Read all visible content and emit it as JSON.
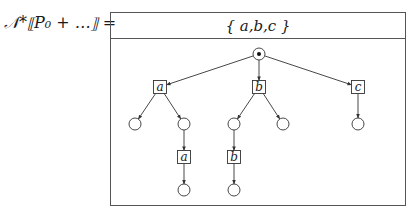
{
  "equation": {
    "lhs": "𝒩*⟦P₀ + …⟧ ="
  },
  "frame": {
    "header": "{ a,b,c }"
  },
  "tree": {
    "root": {
      "id": "root",
      "type": "root-circle",
      "x": 259,
      "y": 54
    },
    "nodes": [
      {
        "id": "a1",
        "type": "box",
        "label": "a",
        "x": 160,
        "y": 87
      },
      {
        "id": "b1",
        "type": "box",
        "label": "b",
        "x": 259,
        "y": 87
      },
      {
        "id": "c1",
        "type": "box",
        "label": "c",
        "x": 358,
        "y": 87
      },
      {
        "id": "a1l",
        "type": "circle",
        "x": 135,
        "y": 124
      },
      {
        "id": "a1r",
        "type": "circle",
        "x": 184,
        "y": 124
      },
      {
        "id": "b1l",
        "type": "circle",
        "x": 234,
        "y": 124
      },
      {
        "id": "b1r",
        "type": "circle",
        "x": 283,
        "y": 124
      },
      {
        "id": "c1c",
        "type": "circle",
        "x": 358,
        "y": 124
      },
      {
        "id": "a2",
        "type": "box",
        "label": "a",
        "x": 184,
        "y": 157
      },
      {
        "id": "b2",
        "type": "box",
        "label": "b",
        "x": 234,
        "y": 157
      },
      {
        "id": "a2c",
        "type": "circle",
        "x": 184,
        "y": 190
      },
      {
        "id": "b2c",
        "type": "circle",
        "x": 234,
        "y": 190
      }
    ],
    "edges": [
      {
        "from": "root",
        "to": "a1",
        "arrow": true
      },
      {
        "from": "root",
        "to": "b1",
        "arrow": true
      },
      {
        "from": "root",
        "to": "c1",
        "arrow": true
      },
      {
        "from": "a1",
        "to": "a1l",
        "arrow": true
      },
      {
        "from": "a1",
        "to": "a1r",
        "arrow": true
      },
      {
        "from": "b1",
        "to": "b1l",
        "arrow": true
      },
      {
        "from": "b1",
        "to": "b1r",
        "arrow": true
      },
      {
        "from": "c1",
        "to": "c1c",
        "arrow": true
      },
      {
        "from": "a1r",
        "to": "a2",
        "arrow": true
      },
      {
        "from": "b1l",
        "to": "b2",
        "arrow": true
      },
      {
        "from": "a2",
        "to": "a2c",
        "arrow": true
      },
      {
        "from": "b2",
        "to": "b2c",
        "arrow": true
      }
    ]
  },
  "colors": {
    "stroke": "#333333",
    "frame": "#555555",
    "background": "#ffffff"
  }
}
